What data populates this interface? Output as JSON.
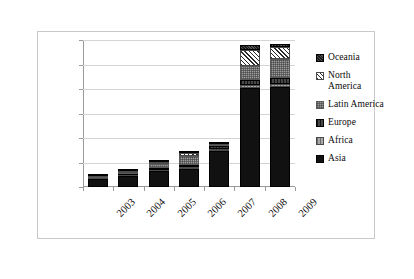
{
  "chart_data": {
    "type": "bar",
    "subtype": "stacked-column",
    "title": "",
    "xlabel": "",
    "ylabel": "",
    "categories": [
      "2003",
      "2004",
      "2005",
      "2006",
      "2007",
      "2008",
      "2009"
    ],
    "ylim": [
      0,
      60000
    ],
    "yticks": [
      0,
      10000,
      20000,
      30000,
      40000,
      50000,
      60000
    ],
    "ytick_labels": [
      "0",
      "10,000",
      "20,000",
      "30,000",
      "40,000",
      "50,000",
      "60,000"
    ],
    "grid": true,
    "legend_position": "right",
    "series": [
      {
        "name": "Asia",
        "values": [
          3400,
          4600,
          6500,
          7400,
          14500,
          40500,
          40800
        ]
      },
      {
        "name": "Africa",
        "values": [
          200,
          300,
          600,
          700,
          900,
          1300,
          1400
        ]
      },
      {
        "name": "Europe",
        "values": [
          250,
          400,
          700,
          900,
          1200,
          2000,
          2100
        ]
      },
      {
        "name": "Latin America",
        "values": [
          300,
          600,
          1500,
          3500,
          700,
          5500,
          7900
        ]
      },
      {
        "name": "North America",
        "values": [
          200,
          800,
          900,
          1200,
          200,
          6500,
          4800
        ]
      },
      {
        "name": "Oceania",
        "values": [
          150,
          300,
          300,
          400,
          200,
          2200,
          1500
        ]
      }
    ],
    "totals": [
      4500,
      7000,
      10500,
      14100,
      17700,
      58000,
      58500
    ]
  },
  "legend": {
    "items": [
      {
        "label": "Oceania",
        "swatch": "oceania-swatch"
      },
      {
        "label": "North America",
        "swatch": "north-america-swatch"
      },
      {
        "label": "Latin America",
        "swatch": "latin-america-swatch"
      },
      {
        "label": "Europe",
        "swatch": "europe-swatch"
      },
      {
        "label": "Africa",
        "swatch": "africa-swatch"
      },
      {
        "label": "Asia",
        "swatch": "asia-swatch"
      }
    ]
  },
  "colors": {
    "asia": "#111111",
    "africa": "#8e8e8e",
    "europe": "#2e2e2e",
    "latin_america": "#9d9d9d",
    "north_america": "#ffffff",
    "oceania": "#3a3a3a",
    "gridline": "#d4d4d4",
    "axis": "#9a9a9a",
    "frame": "#c9c9c9",
    "text": "#0a0a0a"
  }
}
